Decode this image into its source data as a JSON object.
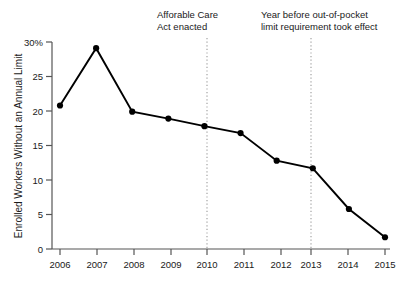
{
  "chart_data": {
    "type": "line",
    "title": "",
    "xlabel": "",
    "ylabel": "Enrolled Workers Without an Annual Limit",
    "x": [
      2006,
      2007,
      2008,
      2009,
      2010,
      2011,
      2012,
      2013,
      2014,
      2015
    ],
    "categories": [
      "2006",
      "2007",
      "2008",
      "2009",
      "2010",
      "2011",
      "2012",
      "2013",
      "2014",
      "2015"
    ],
    "values": [
      20.8,
      29.1,
      19.9,
      18.9,
      17.8,
      16.8,
      12.8,
      11.7,
      5.8,
      1.7
    ],
    "series": [
      {
        "name": "Enrolled Workers Without an Annual Limit",
        "values": [
          20.8,
          29.1,
          19.9,
          18.9,
          17.8,
          16.8,
          12.8,
          11.7,
          5.8,
          1.7
        ]
      }
    ],
    "ylim": [
      0,
      30
    ],
    "xlim": [
      2006,
      2015
    ],
    "yticks": [
      0,
      5,
      10,
      15,
      20,
      25,
      30
    ],
    "ytick_labels": [
      "0",
      "5",
      "10",
      "15",
      "20",
      "25",
      "30%"
    ],
    "xtick_labels": [
      "2006",
      "2007",
      "2008",
      "2009",
      "2010",
      "2011",
      "2012",
      "2013",
      "2014",
      "2015"
    ],
    "grid": false,
    "legend": "none",
    "line_color": "#000000",
    "marker_color": "#000000",
    "marker": "circle",
    "annotations": [
      {
        "id": "aca",
        "text_line1": "Afforable Care",
        "text_line2": "Act enacted",
        "x_value": 2010,
        "rule_color": "#9a9a9a",
        "rule_style": "dotted"
      },
      {
        "id": "oop",
        "text_line1": "Year before out-of-pocket",
        "text_line2": "limit requirement took effect",
        "x_value": 2013,
        "rule_color": "#9a9a9a",
        "rule_style": "dotted"
      }
    ]
  },
  "axes": {
    "y_title": "Enrolled Workers Without an Annual Limit",
    "axis_color": "#555555"
  }
}
